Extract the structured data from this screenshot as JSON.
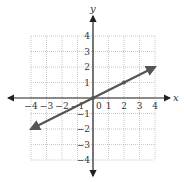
{
  "chart_data": {
    "type": "line",
    "title": "",
    "xlabel": "x",
    "ylabel": "y",
    "xlim": [
      -4,
      4
    ],
    "ylim": [
      -4,
      4
    ],
    "grid": true,
    "x_ticks": [
      "-4",
      "-3",
      "-2",
      "-1",
      "0",
      "1",
      "2",
      "3",
      "4"
    ],
    "y_ticks": [
      "4",
      "3",
      "2",
      "1",
      "-1",
      "-2",
      "-3",
      "-4"
    ],
    "series": [
      {
        "name": "line",
        "x": [
          -4,
          0,
          2,
          4
        ],
        "y": [
          -2,
          0,
          1,
          2
        ],
        "marked_points": [
          [
            0,
            0
          ],
          [
            2,
            1
          ]
        ],
        "arrows_both_ends": true
      }
    ]
  },
  "colors": {
    "axis": "#222222",
    "grid": "#bbbbbb",
    "line": "#555555"
  }
}
